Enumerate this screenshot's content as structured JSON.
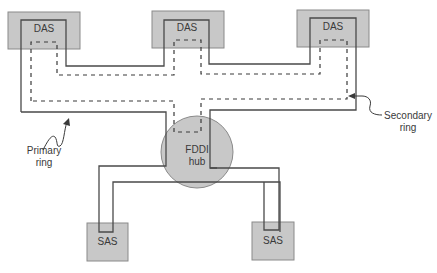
{
  "diagram": {
    "type": "network-topology",
    "nodes": [
      {
        "id": "das1",
        "label": "DAS",
        "kind": "dual-attached-station"
      },
      {
        "id": "das2",
        "label": "DAS",
        "kind": "dual-attached-station"
      },
      {
        "id": "das3",
        "label": "DAS",
        "kind": "dual-attached-station"
      },
      {
        "id": "hub",
        "label_line1": "FDDI",
        "label_line2": "hub",
        "kind": "concentrator"
      },
      {
        "id": "sas1",
        "label": "SAS",
        "kind": "single-attached-station"
      },
      {
        "id": "sas2",
        "label": "SAS",
        "kind": "single-attached-station"
      }
    ],
    "rings": {
      "primary": {
        "label_line1": "Primary",
        "label_line2": "ring",
        "style": "solid"
      },
      "secondary": {
        "label_line1": "Secondary",
        "label_line2": "ring",
        "style": "dashed"
      }
    },
    "colors": {
      "box_fill": "#c8c8c8",
      "box_stroke": "#7a7a7a",
      "line": "#4a4a4a",
      "text": "#3a3a3a"
    }
  }
}
